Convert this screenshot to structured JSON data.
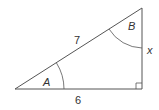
{
  "diagram": {
    "type": "right-triangle",
    "labels": {
      "hypotenuse": "7",
      "base": "6",
      "opposite_side": "x",
      "angle_a": "A",
      "angle_b": "B"
    },
    "colors": {
      "stroke": "#555555",
      "text": "#333333"
    }
  }
}
